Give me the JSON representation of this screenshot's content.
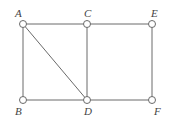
{
  "graph": {
    "nodes": [
      {
        "id": "A",
        "label": "A"
      },
      {
        "id": "B",
        "label": "B"
      },
      {
        "id": "C",
        "label": "C"
      },
      {
        "id": "D",
        "label": "D"
      },
      {
        "id": "E",
        "label": "E"
      },
      {
        "id": "F",
        "label": "F"
      }
    ],
    "edges": [
      [
        "A",
        "C"
      ],
      [
        "C",
        "E"
      ],
      [
        "A",
        "B"
      ],
      [
        "A",
        "D"
      ],
      [
        "C",
        "D"
      ],
      [
        "E",
        "F"
      ],
      [
        "B",
        "D"
      ],
      [
        "D",
        "F"
      ]
    ],
    "colors": {
      "stroke": "#6a6a6a",
      "node_fill": "#ffffff",
      "label": "#444444"
    }
  }
}
